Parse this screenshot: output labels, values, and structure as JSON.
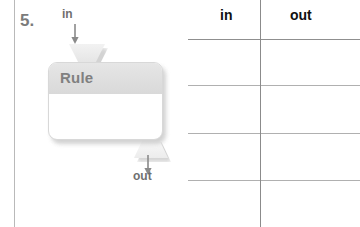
{
  "worksheet": {
    "problem_number": "5.",
    "input_label": "in",
    "output_label": "out",
    "machine_title": "Rule",
    "machine_body_text": ""
  },
  "icons": {
    "input_arrow": "arrow-down-icon",
    "output_arrow": "arrow-down-icon",
    "input_funnel": "funnel-down-icon",
    "output_funnel": "funnel-up-icon"
  },
  "table": {
    "columns": [
      {
        "label": "in"
      },
      {
        "label": "out"
      }
    ],
    "rows": [
      {
        "in": "",
        "out": ""
      },
      {
        "in": "",
        "out": ""
      },
      {
        "in": "",
        "out": ""
      },
      {
        "in": "",
        "out": ""
      }
    ],
    "row_line_positions": [
      39,
      85,
      133,
      180
    ],
    "divider_x": 72
  },
  "colors": {
    "machine_header": "#dedede",
    "machine_title_text": "#808080",
    "label_text": "#6f6f6f",
    "number_text": "#7b7b7b",
    "table_rule": "#8f8f8f",
    "margin_rule": "#b9b9b9"
  }
}
